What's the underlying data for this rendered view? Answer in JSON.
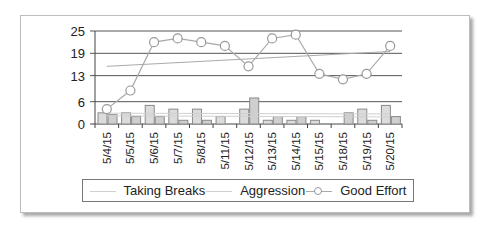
{
  "chart_data": {
    "type": "bar",
    "title": "",
    "xlabel": "",
    "ylabel": "",
    "ylim": [
      0,
      25
    ],
    "yticks": [
      0,
      6,
      13,
      19,
      25
    ],
    "grid": true,
    "legend_position": "bottom",
    "categories": [
      "5/4/15",
      "5/5/15",
      "5/6/15",
      "5/7/15",
      "5/8/15",
      "5/11/15",
      "5/12/15",
      "5/13/15",
      "5/14/15",
      "5/15/15",
      "5/18/15",
      "5/19/15",
      "5/20/15"
    ],
    "series": [
      {
        "name": "Taking Breaks",
        "type": "bar",
        "values": [
          3,
          3,
          5,
          4,
          4,
          2,
          4,
          1,
          1,
          1,
          0,
          4,
          5
        ],
        "trendline": [
          2.9,
          2.7
        ]
      },
      {
        "name": "Aggression",
        "type": "bar",
        "values": [
          2.5,
          2,
          2,
          1,
          1,
          0,
          7,
          2,
          2,
          0,
          3,
          1,
          2
        ],
        "trendline": [
          2.2,
          1.9
        ]
      },
      {
        "name": "Good Effort",
        "type": "line",
        "marker": "circle",
        "values": [
          4,
          9,
          22,
          23,
          22,
          21,
          15.5,
          23,
          24,
          13.5,
          12,
          13.5,
          21
        ],
        "trendline": [
          15.5,
          19.5
        ]
      }
    ]
  },
  "legend": {
    "items": [
      {
        "label": "Taking Breaks"
      },
      {
        "label": "Aggression"
      },
      {
        "label": "Good Effort"
      }
    ]
  },
  "colors": {
    "bar_fill": "#d9d9d9",
    "bar_stroke": "#8a8a8a",
    "line": "#aaaaaa",
    "grid": "#555555",
    "trend_light": "#d0d0d0"
  }
}
